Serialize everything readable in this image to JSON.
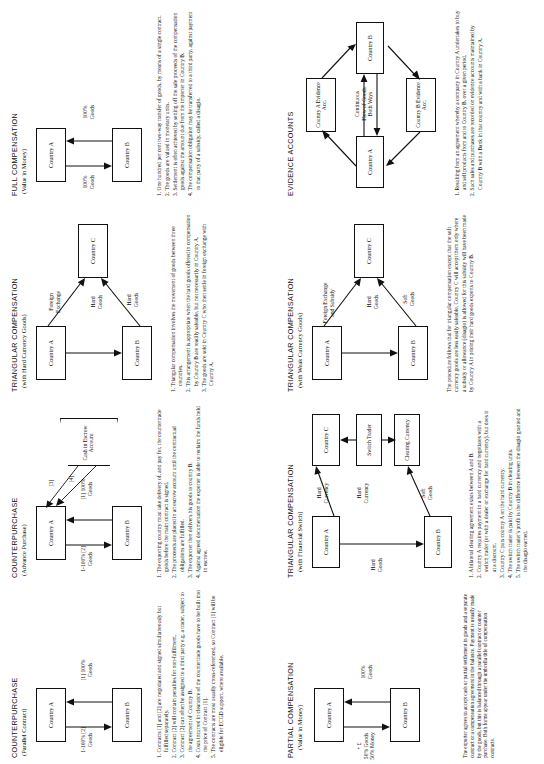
{
  "sheet": {
    "orientation": "landscape-rotated-90ccw",
    "panel_count": 8
  },
  "panels": [
    {
      "id": "counterpurchase-parallel",
      "title": "COUNTERPURCHASE",
      "subtitle": "(Parallel Contract)",
      "nodes": [
        {
          "name": "country-a",
          "label": "Country A"
        },
        {
          "name": "country-b",
          "label": "Country B"
        }
      ],
      "flow_labels": [
        {
          "name": "flow-a-to-b",
          "text": "[1] 100%\nGoods"
        },
        {
          "name": "flow-b-to-a",
          "text": "1-100% [2]\nGoods"
        }
      ],
      "notes": [
        "1. Contracts [1] and [2] are negotiated and signed simultaneously but fulfilled separately.",
        "2. Contract [2] will contain penalties for non-fulfilment.",
        "3. Contract [2] can often be assigned to a third party e.g. a trader, subject to the agreement of Country B.",
        "4. Costs incurred in clearance of the countertrade goods have to be built into the price of Contract [1].",
        "5. The contracts are most usually cross-referenced, so Contract [1] will be eligible for ECGD support, where available."
      ]
    },
    {
      "id": "counterpurchase-advance",
      "title": "COUNTERPURCHASE",
      "subtitle": "(Advance Purchase)",
      "nodes": [
        {
          "name": "country-a",
          "label": "Country A"
        },
        {
          "name": "country-b",
          "label": "Country B"
        },
        {
          "name": "cash-escrow",
          "label": "Cash in\nEscrow\nAccount"
        }
      ],
      "flow_labels": [
        {
          "name": "flow-a-to-b",
          "text": "[1] 100%\nGoods"
        },
        {
          "name": "flow-b-to-a",
          "text": "1-100% [2]\nGoods"
        },
        {
          "name": "escrow-step-3",
          "text": "[3]"
        },
        {
          "name": "escrow-step-4",
          "text": "[4]"
        }
      ],
      "notes": [
        "1. The exporting country must take delivery of, and pay for, the countertrade goods before the main contract is signed.",
        "2. The proceeds are placed in an escrow account until the contractual obligations are fulfilled.",
        "3. The exporter then delivers his goods to country B.",
        "4. Against agreed documentation the exporter is able to reclaim the funds held in escrow."
      ]
    },
    {
      "id": "triangular-hard-currency",
      "title": "TRIANGULAR COMPENSATION",
      "subtitle": "(with Hard Currency Goods)",
      "nodes": [
        {
          "name": "country-a",
          "label": "Country A"
        },
        {
          "name": "country-b",
          "label": "Country B"
        },
        {
          "name": "country-c",
          "label": "Country C"
        }
      ],
      "flow_labels": [
        {
          "name": "flow-a-to-b-hard-goods",
          "text": "Hard\nGoods"
        },
        {
          "name": "flow-a-to-c-foreign-exchange",
          "text": "Foreign\nExchange"
        },
        {
          "name": "flow-b-to-c-hard-goods",
          "text": "Hard\nGoods"
        }
      ],
      "notes": [
        "1. Triangular compensation involves the movement of goods between three countries.",
        "2. This arrangement is appropriate when the hard goods offered in compensation by Country B are readily saleable, but not necessarily in Country A.",
        "3. The goods are sold in Country C who then settle in foreign exchange with Country A."
      ]
    },
    {
      "id": "full-compensation",
      "title": "FULL COMPENSATION",
      "subtitle": "(Value in Money)",
      "nodes": [
        {
          "name": "country-a",
          "label": "Country A"
        },
        {
          "name": "country-b",
          "label": "Country B"
        }
      ],
      "flow_labels": [
        {
          "name": "flow-a-to-b",
          "text": "100%\nGoods"
        },
        {
          "name": "flow-b-to-a",
          "text": "100%\nGoods"
        }
      ],
      "notes": [
        "1. One hundred per cent two-way transfer of goods, by means of a single contract.",
        "2. The goods are valued in monetary units.",
        "3. Settlement is often achieved by setting off the sale proceeds of the compensation goods against the amount due from the importer in Country B.",
        "4. The compensation obligation may be transferred to a third party, against payment to that party of a subsidy, called a disagio."
      ]
    },
    {
      "id": "partial-compensation",
      "title": "PARTIAL COMPENSATION",
      "subtitle": "(Value in Money)",
      "nodes": [
        {
          "name": "country-a",
          "label": "Country A"
        },
        {
          "name": "country-b",
          "label": "Country B"
        }
      ],
      "flow_labels": [
        {
          "name": "flow-a-to-b",
          "text": "100%\nGoods"
        },
        {
          "name": "flow-b-to-a",
          "text": "+ £\n50% Goods\n50% Money"
        }
      ],
      "notes": []
    },
    {
      "id": "triangular-financial-switch",
      "title": "TRIANGULAR COMPENSATION",
      "subtitle": "(with Financial Switch)",
      "nodes": [
        {
          "name": "country-a",
          "label": "Country A"
        },
        {
          "name": "country-b",
          "label": "Country B"
        },
        {
          "name": "country-c",
          "label": "Country C"
        },
        {
          "name": "switch-trader",
          "label": "Switch\nTrader"
        },
        {
          "name": "clearing-currency",
          "label": "Clearing\nCurrency"
        }
      ],
      "flow_labels": [
        {
          "name": "flow-hard-currency-top",
          "text": "Hard\nCurrency"
        },
        {
          "name": "flow-hard-currency-mid",
          "text": "Hard\nCurrency"
        },
        {
          "name": "flow-soft-goods",
          "text": "Soft\nGoods"
        },
        {
          "name": "flow-hard-goods",
          "text": "Hard\nGoods"
        }
      ],
      "notes": [
        "1. A bilateral clearing agreement exists between A and B.",
        "2. Country A requires payment in a hard currency and negotiates with a switch trader (or with a dealer or exchange for hard currency), but does it at a discount.",
        "3. Country C puts country A on the hard currency.",
        "4. The switch trader is paid by Country B in clearing units.",
        "5. The switch trader's profit is the difference between the disagio granted and the disagio earned."
      ]
    },
    {
      "id": "triangular-weak-currency",
      "title": "TRIANGULAR COMPENSATION",
      "subtitle": "(with Weak Currency Goods)",
      "nodes": [
        {
          "name": "country-a",
          "label": "Country A"
        },
        {
          "name": "country-b",
          "label": "Country B"
        },
        {
          "name": "country-c",
          "label": "Country C"
        }
      ],
      "flow_labels": [
        {
          "name": "flow-a-to-b-hard-goods",
          "text": "Hard\nGoods"
        },
        {
          "name": "flow-a-to-c-fx-subsidy",
          "text": "Foreign Exchange\nand Subsidy"
        },
        {
          "name": "flow-b-to-c-soft-goods",
          "text": "Soft\nGoods"
        }
      ],
      "notes": [
        "The procedure follows that for triangular compensation except that the soft currency goods are less easily saleable. Country C will accept them only where a subsidy or allowance (disagio) is allowed for this subsidy will have been made by Country A in pricing their hard goods exports to Country B."
      ]
    },
    {
      "id": "evidence-accounts",
      "title": "EVIDENCE ACCOUNTS",
      "subtitle": "",
      "nodes": [
        {
          "name": "country-a",
          "label": "Country A"
        },
        {
          "name": "country-b",
          "label": "Country B"
        },
        {
          "name": "country-a-evidence-acc",
          "label": "Country A\nEvidence\nAcc."
        },
        {
          "name": "country-b-evidence-acc",
          "label": "Country B\nEvidence\nAcc."
        }
      ],
      "flow_labels": [
        {
          "name": "flow-continuous-goods",
          "text": "Continuous\nFlow of Goods\nBoth Ways"
        }
      ],
      "notes": [
        "1. Resulting from an agreement whereby a company in Country A undertakes to buy and sell products from and to Country B, over a given period.",
        "2. Such sales and purchases are recorded on evidence accounts maintained by Country B with a Bank in that country and with a bank in Country A."
      ]
    },
    {
      "id": "industrial-co-operation",
      "title": "INDUSTRIAL CO-OPERATION",
      "subtitle": "",
      "nodes": [
        {
          "name": "country-a",
          "label": "Country A"
        },
        {
          "name": "country-b",
          "label": "Country B"
        }
      ],
      "flow_labels": [
        {
          "name": "flow-technology-transfer",
          "text": "Technology\nTransfer"
        },
        {
          "name": "flow-contracted-products",
          "text": "Contracted\nProducts"
        }
      ],
      "notes": [
        "1. A plant, factory or licence is sold to Country B",
        "2. Long term finance is secured in Country A.",
        "3. Products connected with the technology transferred are accepted over an agreed period - usually a number of years - by Country A.",
        "4. The sale of these goods provides the means for repayment of the long term finance."
      ]
    }
  ],
  "footnote": {
    "name": "sheet-footnote",
    "text": "The exporter agrees to accept cash or partial settlement in goods and a separate contract or a compensation agreement in the balance. Payment is usually made by the goods, but this is balanced through a parallel contract or counter purchase. Both forms appear under the umbrella title of compensation contracts."
  }
}
